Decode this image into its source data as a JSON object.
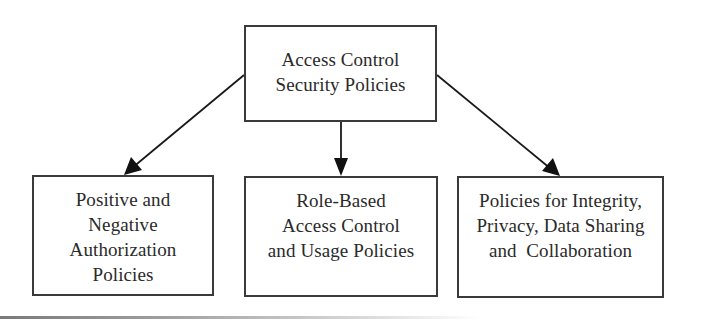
{
  "diagram": {
    "type": "hierarchy",
    "root": {
      "id": "root",
      "lines": [
        "Access Control",
        "Security Policies"
      ]
    },
    "children": [
      {
        "id": "pos-neg",
        "lines": [
          "Positive and",
          "Negative",
          "Authorization",
          "Policies"
        ]
      },
      {
        "id": "rbac",
        "lines": [
          "Role-Based",
          "Access Control",
          "and Usage Policies"
        ]
      },
      {
        "id": "integrity",
        "lines": [
          "Policies for Integrity,",
          "Privacy, Data Sharing",
          "and  Collaboration"
        ]
      }
    ],
    "edges": [
      {
        "from": "root",
        "to": "pos-neg"
      },
      {
        "from": "root",
        "to": "rbac"
      },
      {
        "from": "root",
        "to": "integrity"
      }
    ],
    "colors": {
      "border": "#3a3a3a",
      "arrow": "#1a1a1a",
      "text": "#2a2a2a",
      "background": "#ffffff"
    }
  }
}
